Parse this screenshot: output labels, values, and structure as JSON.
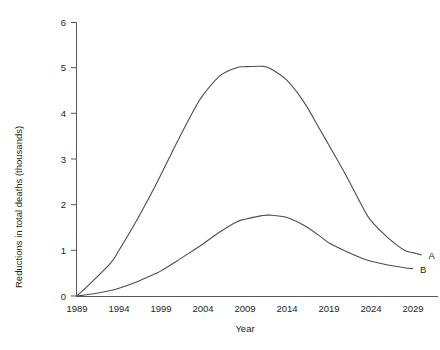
{
  "chart_data": {
    "type": "line",
    "title": "",
    "xlabel": "Year",
    "ylabel": "Reductions in total deaths (thousands)",
    "xlim": [
      1989,
      2031
    ],
    "ylim": [
      0,
      6
    ],
    "xticks": [
      1989,
      1994,
      1999,
      2004,
      2009,
      2014,
      2019,
      2024,
      2029
    ],
    "yticks": [
      0,
      1,
      2,
      3,
      4,
      5,
      6
    ],
    "xtick_labels": [
      "1989",
      "1994",
      "1999",
      "2004",
      "2009",
      "2014",
      "2019",
      "2024",
      "2029"
    ],
    "ytick_labels": [
      "0",
      "1",
      "2",
      "3",
      "4",
      "5",
      "6"
    ],
    "grid": false,
    "legend": "inline-end-labels",
    "series": [
      {
        "name": "A",
        "label": "A",
        "color": "#4d4d4d",
        "x": [
          1989,
          1991,
          1993,
          1994,
          1996,
          1998,
          1999,
          2001,
          2003,
          2004,
          2006,
          2008,
          2009,
          2011,
          2012,
          2014,
          2016,
          2018,
          2019,
          2021,
          2023,
          2024,
          2026,
          2028,
          2029,
          2030
        ],
        "values": [
          0.0,
          0.35,
          0.72,
          1.0,
          1.62,
          2.3,
          2.66,
          3.4,
          4.1,
          4.4,
          4.82,
          5.0,
          5.02,
          5.03,
          4.98,
          4.72,
          4.25,
          3.62,
          3.3,
          2.65,
          1.95,
          1.65,
          1.28,
          1.0,
          0.95,
          0.9
        ]
      },
      {
        "name": "B",
        "label": "B",
        "color": "#4d4d4d",
        "x": [
          1989,
          1991,
          1993,
          1994,
          1996,
          1998,
          1999,
          2001,
          2003,
          2004,
          2006,
          2008,
          2009,
          2011,
          2012,
          2014,
          2016,
          2018,
          2019,
          2021,
          2023,
          2024,
          2026,
          2028,
          2029
        ],
        "values": [
          0.0,
          0.05,
          0.12,
          0.17,
          0.3,
          0.46,
          0.55,
          0.78,
          1.02,
          1.14,
          1.4,
          1.62,
          1.68,
          1.76,
          1.77,
          1.72,
          1.55,
          1.3,
          1.16,
          0.98,
          0.82,
          0.76,
          0.68,
          0.62,
          0.6
        ]
      }
    ]
  },
  "figure": {
    "caption_fragment": ""
  }
}
